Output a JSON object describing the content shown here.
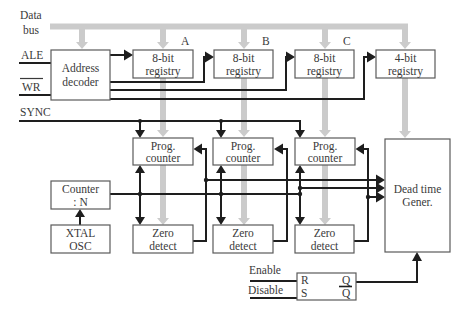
{
  "diagram": {
    "bus": {
      "label_line1": "Data",
      "label_line2": "bus",
      "color": "#cbcbcb"
    },
    "inputs": {
      "ale": "ALE",
      "wr": "WR",
      "sync": "SYNC",
      "enable": "Enable",
      "disable": "Disable"
    },
    "blocks": {
      "address_decoder": {
        "line1": "Address",
        "line2": "decoder"
      },
      "registry_a": {
        "tag": "A",
        "line1": "8-bit",
        "line2": "registry"
      },
      "registry_b": {
        "tag": "B",
        "line1": "8-bit",
        "line2": "registry"
      },
      "registry_c": {
        "tag": "C",
        "line1": "8-bit",
        "line2": "registry"
      },
      "registry_4bit": {
        "line1": "4-bit",
        "line2": "registry"
      },
      "prog_counter_1": {
        "line1": "Prog.",
        "line2": "counter"
      },
      "prog_counter_2": {
        "line1": "Prog.",
        "line2": "counter"
      },
      "prog_counter_3": {
        "line1": "Prog.",
        "line2": "counter"
      },
      "counter_n": {
        "line1": "Counter",
        "line2": ": N"
      },
      "xtal_osc": {
        "line1": "XTAL",
        "line2": "OSC"
      },
      "zero_detect_1": {
        "line1": "Zero",
        "line2": "detect"
      },
      "zero_detect_2": {
        "line1": "Zero",
        "line2": "detect"
      },
      "zero_detect_3": {
        "line1": "Zero",
        "line2": "detect"
      },
      "dead_time_gen": {
        "line1": "Dead time",
        "line2": "Gener."
      },
      "sr_latch": {
        "r": "R",
        "s": "S",
        "q": "Q",
        "q_bar": "Q"
      }
    }
  }
}
